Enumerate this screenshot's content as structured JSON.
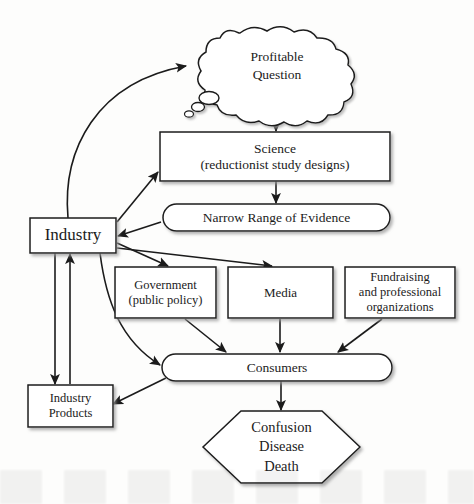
{
  "diagram": {
    "type": "flowchart",
    "colors": {
      "background": "#fdfdfc",
      "stroke": "#1b1b1b",
      "fill": "#ffffff",
      "text": "#1b1b1b",
      "shadow": "#b9b9b9"
    },
    "nodes": [
      {
        "id": "profitable-question",
        "label": "Profitable\nQuestion",
        "shape": "thought-bubble"
      },
      {
        "id": "science",
        "label": "Science\n(reductionist study designs)",
        "shape": "rectangle"
      },
      {
        "id": "narrow-range-of-evidence",
        "label": "Narrow Range of Evidence",
        "shape": "stadium"
      },
      {
        "id": "industry",
        "label": "Industry",
        "shape": "rectangle"
      },
      {
        "id": "government",
        "label": "Government\n(public policy)",
        "shape": "rectangle"
      },
      {
        "id": "media",
        "label": "Media",
        "shape": "rectangle"
      },
      {
        "id": "fundraising",
        "label": "Fundraising\nand professional\norganizations",
        "shape": "rectangle"
      },
      {
        "id": "consumers",
        "label": "Consumers",
        "shape": "stadium"
      },
      {
        "id": "industry-products",
        "label": "Industry\nProducts",
        "shape": "rectangle"
      },
      {
        "id": "outcome",
        "label": "Confusion\nDisease\nDeath",
        "shape": "hexagon"
      }
    ],
    "edges": [
      {
        "from": "industry",
        "to": "profitable-question",
        "style": "curved"
      },
      {
        "from": "profitable-question",
        "to": "science",
        "style": "straight"
      },
      {
        "from": "industry",
        "to": "science",
        "style": "straight"
      },
      {
        "from": "science",
        "to": "narrow-range-of-evidence",
        "style": "straight"
      },
      {
        "from": "narrow-range-of-evidence",
        "to": "industry",
        "style": "straight"
      },
      {
        "from": "industry",
        "to": "government",
        "style": "straight"
      },
      {
        "from": "industry",
        "to": "media",
        "style": "straight"
      },
      {
        "from": "industry",
        "to": "consumers",
        "style": "curved"
      },
      {
        "from": "government",
        "to": "consumers",
        "style": "straight"
      },
      {
        "from": "media",
        "to": "consumers",
        "style": "straight"
      },
      {
        "from": "fundraising",
        "to": "consumers",
        "style": "straight"
      },
      {
        "from": "consumers",
        "to": "industry-products",
        "style": "straight"
      },
      {
        "from": "industry",
        "to": "industry-products",
        "style": "straight"
      },
      {
        "from": "industry-products",
        "to": "industry",
        "style": "straight"
      },
      {
        "from": "consumers",
        "to": "outcome",
        "style": "straight"
      }
    ]
  }
}
